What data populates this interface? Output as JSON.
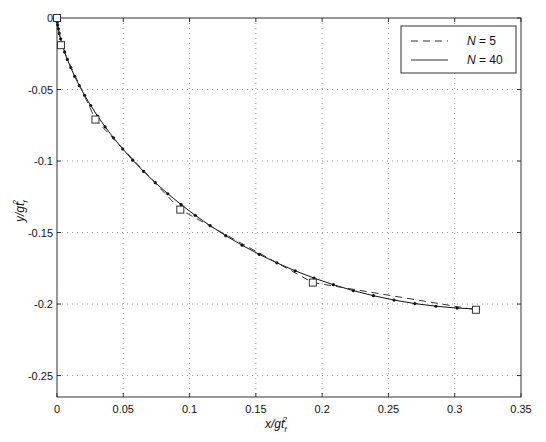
{
  "chart_data": {
    "type": "line",
    "title": "",
    "xlabel": "x/gt_f^2",
    "ylabel": "y/gt_f^2",
    "xlim": [
      0,
      0.35
    ],
    "ylim": [
      -0.265,
      0
    ],
    "grid": true,
    "legend_position": "upper right",
    "x_ticks": [
      0,
      0.05,
      0.1,
      0.15,
      0.2,
      0.25,
      0.3,
      0.35
    ],
    "x_tick_labels": [
      "0",
      "0.05",
      "0.1",
      "0.15",
      "0.2",
      "0.25",
      "0.3",
      "0.35"
    ],
    "y_ticks": [
      0,
      -0.05,
      -0.1,
      -0.15,
      -0.2,
      -0.25
    ],
    "y_tick_labels": [
      "0",
      "-0.05",
      "-0.1",
      "-0.15",
      "-0.2",
      "-0.25"
    ],
    "series": [
      {
        "name": "N = 5",
        "style": "dashed",
        "marker": "square",
        "x": [
          0,
          0.003,
          0.029,
          0.093,
          0.193,
          0.316
        ],
        "y": [
          0,
          -0.019,
          -0.071,
          -0.134,
          -0.185,
          -0.204
        ]
      },
      {
        "name": "N = 40",
        "style": "solid",
        "marker": "dot",
        "x": [
          0,
          1e-05,
          7e-05,
          0.00022,
          0.00052,
          0.00101,
          0.00174,
          0.00275,
          0.0041,
          0.0058,
          0.00791,
          0.01043,
          0.0134,
          0.01683,
          0.02074,
          0.02514,
          0.03003,
          0.03543,
          0.04132,
          0.04772,
          0.05461,
          0.06198,
          0.06983,
          0.07813,
          0.08687,
          0.09602,
          0.10556,
          0.11545,
          0.12567,
          0.13619,
          0.14697,
          0.15798,
          0.16917,
          0.18051,
          0.19196,
          0.20347,
          0.215,
          0.22651,
          0.23796,
          0.2493,
          0.318
        ],
        "y": [
          0,
          -0.00031,
          -0.00125,
          -0.0028,
          -0.00497,
          -0.00773,
          -0.01108,
          -0.015,
          -0.01947,
          -0.02445,
          -0.02993,
          -0.03588,
          -0.04226,
          -0.04904,
          -0.05619,
          -0.06367,
          -0.07145,
          -0.07948,
          -0.08772,
          -0.09614,
          -0.1047,
          -0.11335,
          -0.12206,
          -0.13078,
          -0.13946,
          -0.14806,
          -0.15654,
          -0.16485,
          -0.17295,
          -0.1808,
          -0.18835,
          -0.19557,
          -0.20241,
          -0.20884,
          -0.21482,
          -0.22033,
          -0.22533,
          -0.2298,
          -0.23371,
          -0.23705,
          -0.2035
        ]
      }
    ]
  },
  "legend": {
    "items": [
      {
        "label": "N = 5",
        "style": "dashed"
      },
      {
        "label": "N = 40",
        "style": "solid"
      }
    ]
  },
  "axes": {
    "xlabel_main": "x/gt",
    "xlabel_sup": "2",
    "xlabel_sub": "f",
    "ylabel_main": "y/gt",
    "ylabel_sup": "2",
    "ylabel_sub": "f"
  }
}
